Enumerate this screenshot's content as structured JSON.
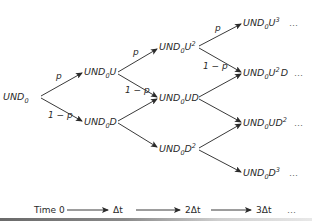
{
  "diagram": {
    "type": "binomial-tree",
    "nodes": [
      {
        "id": "n0",
        "base": "UND",
        "sub": "0",
        "tail": "",
        "sup": "",
        "tail2": "",
        "step": 0
      },
      {
        "id": "n1u",
        "base": "UND",
        "sub": "0",
        "tail": "U",
        "sup": "",
        "tail2": "",
        "step": 1
      },
      {
        "id": "n1d",
        "base": "UND",
        "sub": "0",
        "tail": "D",
        "sup": "",
        "tail2": "",
        "step": 1
      },
      {
        "id": "n2uu",
        "base": "UND",
        "sub": "0",
        "tail": "U",
        "sup": "2",
        "tail2": "",
        "step": 2
      },
      {
        "id": "n2ud",
        "base": "UND",
        "sub": "0",
        "tail": "UD",
        "sup": "",
        "tail2": "",
        "step": 2
      },
      {
        "id": "n2dd",
        "base": "UND",
        "sub": "0",
        "tail": "D",
        "sup": "2",
        "tail2": "",
        "step": 2
      },
      {
        "id": "n3uuu",
        "base": "UND",
        "sub": "0",
        "tail": "U",
        "sup": "3",
        "tail2": "",
        "step": 3
      },
      {
        "id": "n3uud",
        "base": "UND",
        "sub": "0",
        "tail": "U",
        "sup": "2",
        "tail2": "D",
        "step": 3
      },
      {
        "id": "n3udd",
        "base": "UND",
        "sub": "0",
        "tail": "UD",
        "sup": "2",
        "tail2": "",
        "step": 3
      },
      {
        "id": "n3ddd",
        "base": "UND",
        "sub": "0",
        "tail": "D",
        "sup": "3",
        "tail2": "",
        "step": 3
      }
    ],
    "edge_labels": {
      "up": "p",
      "down": "1 − p"
    },
    "continuation": "…",
    "timeline": {
      "start": "Time 0",
      "steps": [
        "Δt",
        "2Δt",
        "3Δt"
      ],
      "continuation": "…"
    }
  }
}
